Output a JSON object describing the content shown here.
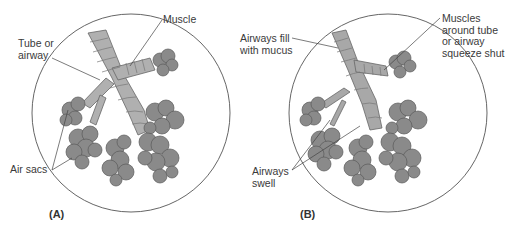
{
  "figure": {
    "panels": [
      {
        "id": "A",
        "letter": "(A)",
        "description": "normal airway",
        "labels": {
          "muscle": "Muscle",
          "tube_line1": "Tube or",
          "tube_line2": "airway",
          "air_sacs": "Air sacs"
        }
      },
      {
        "id": "B",
        "letter": "(B)",
        "description": "constricted airway",
        "labels": {
          "mucus_line1": "Airways fill",
          "mucus_line2": "with mucus",
          "muscles_line1": "Muscles",
          "muscles_line2": "around tube",
          "muscles_line3": "or airway",
          "muscles_line4": "squeeze shut",
          "swell_line1": "Airways",
          "swell_line2": "swell"
        }
      }
    ],
    "colors": {
      "airway": "#a9a9a9",
      "air_sac": "#8a8a8a",
      "outline": "#555555",
      "circle": "#666666",
      "text": "#3a3a3a"
    }
  }
}
